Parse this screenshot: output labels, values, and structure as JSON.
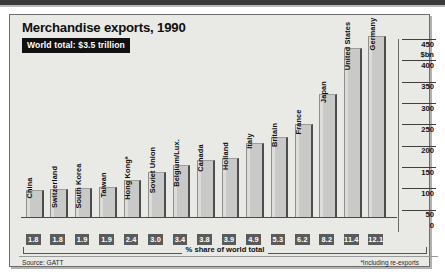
{
  "chart_data": {
    "type": "bar",
    "title": "Merchandise exports, 1990",
    "subtitle": "World total: $3.5 trillion",
    "xlabel": "% share of world total",
    "ylabel": "$bn",
    "ylim": [
      0,
      450
    ],
    "yticks": [
      0,
      50,
      100,
      150,
      200,
      250,
      300,
      350,
      400,
      450
    ],
    "ytick_labels": [
      "0",
      "50",
      "100",
      "150",
      "200",
      "250",
      "300",
      "350",
      "400",
      "450"
    ],
    "grid": false,
    "legend": null,
    "categories": [
      "China",
      "Switzerland",
      "South Korea",
      "Taiwan",
      "Hong Kong*",
      "Soviet Union",
      "Belgium/Lux.",
      "Canada",
      "Holland",
      "Italy",
      "Britain",
      "France",
      "Japan",
      "United States",
      "Germany"
    ],
    "values": [
      62,
      64,
      65,
      67,
      85,
      104,
      119,
      132,
      136,
      170,
      185,
      216,
      287,
      394,
      421
    ],
    "share_labels": [
      "1.8",
      "1.8",
      "1.9",
      "1.9",
      "2.4",
      "3.0",
      "3.4",
      "3.8",
      "3.9",
      "4.9",
      "5.3",
      "6.2",
      "8.2",
      "11.4",
      "12.1"
    ],
    "source": "Source: GATT",
    "footnote": "*Including re-exports"
  }
}
